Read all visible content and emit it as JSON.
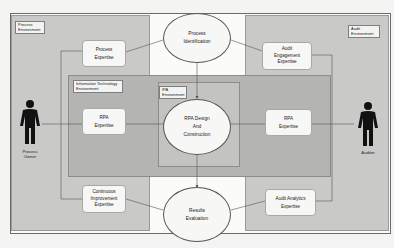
{
  "environments": {
    "process": "Process Environment",
    "audit": "Audit Environment",
    "it": "Information Technology Environment",
    "ipa": "IPA Environment"
  },
  "ellipses": {
    "process_identification": [
      "Process",
      "Identification"
    ],
    "rpa_design": [
      "RPA Design",
      "And",
      "Construction"
    ],
    "results_evaluation": [
      "Results",
      "Evaluation"
    ]
  },
  "boxes": {
    "process_expertise": [
      "Process",
      "Expertise"
    ],
    "rpa_expertise_left": [
      "RPA",
      "Expertise"
    ],
    "continuous_improvement": [
      "Continuous",
      "Improvement",
      "Expertise"
    ],
    "audit_engagement": [
      "Audit",
      "Engagement",
      "Expertise"
    ],
    "rpa_expertise_right": [
      "RPA",
      "Expertise"
    ],
    "audit_analytics": [
      "Audit Analytics",
      "Expertise"
    ]
  },
  "actors": {
    "process_owner": [
      "Process",
      "Owner"
    ],
    "auditor": "Auditor"
  },
  "colors": {
    "environment_fill": "#c9c9c7",
    "it_fill": "#b4b4b2",
    "ipa_fill": "#c3c3c1",
    "node_fill": "#f7f7f5",
    "actor": "#111111",
    "connector": "#555555"
  }
}
